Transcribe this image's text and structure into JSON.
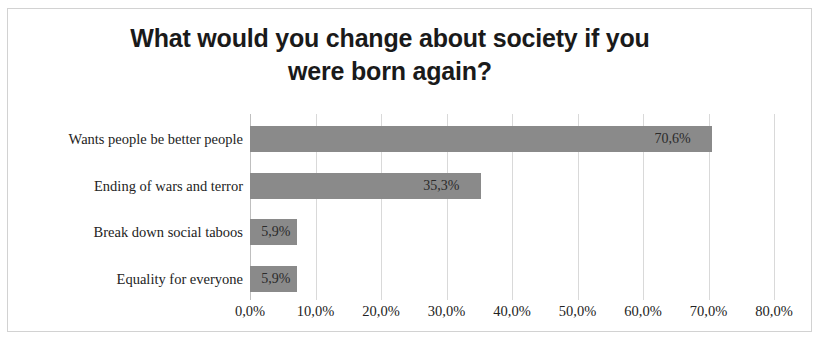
{
  "chart_data": {
    "type": "bar",
    "orientation": "horizontal",
    "title": "What would you change about society if you were born again?",
    "title_line1": "What would you change about society if you",
    "title_line2": "were born again?",
    "categories": [
      "Wants people be better people",
      "Ending of wars and terror",
      "Break down social taboos",
      "Equality for everyone"
    ],
    "values": [
      70.6,
      35.3,
      5.9,
      5.9
    ],
    "data_labels": [
      "70,6%",
      "35,3%",
      "5,9%",
      "5,9%"
    ],
    "xlabel": "",
    "ylabel": "",
    "xlim": [
      0,
      80
    ],
    "x_tick_values": [
      0,
      10,
      20,
      30,
      40,
      50,
      60,
      70,
      80
    ],
    "x_tick_labels": [
      "0,0%",
      "10,0%",
      "20,0%",
      "30,0%",
      "40,0%",
      "50,0%",
      "60,0%",
      "70,0%",
      "80,0%"
    ],
    "grid": "vertical",
    "legend": "none",
    "bar_color": "#8a8a8a",
    "gridline_color": "#d9d9d9",
    "border_color": "#d2d2d2",
    "background_color": "#ffffff",
    "text_color": "#232323",
    "decimal_separator": ","
  }
}
